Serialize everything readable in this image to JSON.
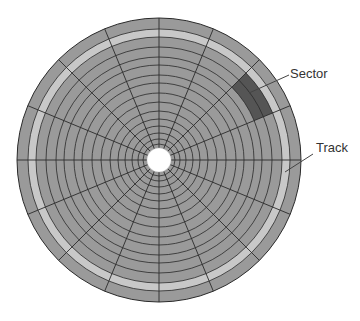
{
  "diagram": {
    "center": [
      159,
      160
    ],
    "ring_radii": [
      142,
      131,
      123,
      113,
      103,
      95,
      85,
      77,
      67,
      58,
      49,
      41,
      34,
      27,
      21,
      16
    ],
    "hole_radius": 12,
    "sector_count": 16,
    "sector_angle_offset_deg": 0,
    "highlight_track_index": 1,
    "highlight_sector": {
      "ring_outer_index": 2,
      "ring_inner_index": 4,
      "start_deg": 45,
      "end_deg": 67.5
    },
    "colors": {
      "disk": "#9a9a9a",
      "track_highlight": "#c8c8c8",
      "sector_highlight": "#555555",
      "lines": "#2a2a2a",
      "hole": "#ffffff",
      "leader": "#444444"
    }
  },
  "labels": {
    "sector": {
      "text": "Sector",
      "x": 290,
      "y": 67,
      "leader": [
        [
          249,
          93
        ],
        [
          289,
          75
        ]
      ]
    },
    "track": {
      "text": "Track",
      "x": 316,
      "y": 141,
      "leader": [
        [
          285,
          172
        ],
        [
          313,
          154
        ]
      ]
    }
  }
}
